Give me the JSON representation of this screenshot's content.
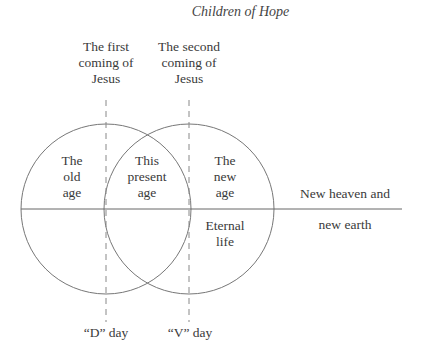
{
  "title": "Children of Hope",
  "top_labels": {
    "first_coming": [
      "The first",
      "coming of",
      "Jesus"
    ],
    "second_coming": [
      "The second",
      "coming of",
      "Jesus"
    ]
  },
  "regions": {
    "old_age": [
      "The",
      "old",
      "age"
    ],
    "present_age": [
      "This",
      "present",
      "age"
    ],
    "new_age": [
      "The",
      "new",
      "age"
    ],
    "eternal_life": [
      "Eternal",
      "life"
    ],
    "new_heaven": "New heaven and",
    "new_earth": "new earth"
  },
  "bottom_labels": {
    "d_day": "“D” day",
    "v_day": "“V” day"
  },
  "colors": {
    "line": "#777777",
    "text": "#3a3a3a"
  }
}
